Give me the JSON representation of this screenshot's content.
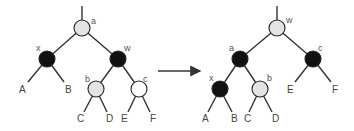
{
  "diagram": {
    "type": "tree-rotation",
    "colors": {
      "black": "#111111",
      "gray": "#e3e3e3",
      "white": "#ffffff",
      "edge": "#333333"
    },
    "before": {
      "nodes": [
        {
          "id": "a",
          "label": "a",
          "color": "gray"
        },
        {
          "id": "x",
          "label": "x",
          "color": "black"
        },
        {
          "id": "w",
          "label": "w",
          "color": "black"
        },
        {
          "id": "b",
          "label": "b",
          "color": "gray"
        },
        {
          "id": "c",
          "label": "c",
          "color": "white"
        }
      ],
      "leaves": [
        "A",
        "B",
        "C",
        "D",
        "E",
        "F"
      ]
    },
    "after": {
      "nodes": [
        {
          "id": "w",
          "label": "w",
          "color": "gray"
        },
        {
          "id": "a",
          "label": "a",
          "color": "black"
        },
        {
          "id": "c",
          "label": "c",
          "color": "black"
        },
        {
          "id": "x",
          "label": "x",
          "color": "black"
        },
        {
          "id": "b",
          "label": "b",
          "color": "gray"
        }
      ],
      "leaves": [
        "A",
        "B",
        "C",
        "D",
        "E",
        "F"
      ]
    },
    "arrow": "transforms-to"
  }
}
